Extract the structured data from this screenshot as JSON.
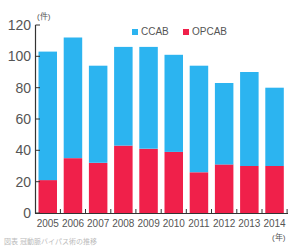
{
  "chart_data": {
    "type": "bar",
    "stacked": true,
    "title": "",
    "xlabel": "(年)",
    "ylabel": "(件)",
    "ylim": [
      0,
      120
    ],
    "yticks": [
      0,
      20,
      40,
      60,
      80,
      100,
      120
    ],
    "grid": false,
    "legend_position": "top-right",
    "categories": [
      "2005",
      "2006",
      "2007",
      "2008",
      "2009",
      "2010",
      "2011",
      "2012",
      "2013",
      "2014"
    ],
    "totals": [
      103,
      112,
      94,
      106,
      106,
      101,
      94,
      83,
      90,
      80
    ],
    "series": [
      {
        "name": "OPCAB",
        "color": "#f0204a",
        "values": [
          21,
          35,
          32,
          43,
          41,
          39,
          26,
          31,
          30,
          30
        ]
      },
      {
        "name": "CCAB",
        "color": "#2cb4f0",
        "values": [
          82,
          77,
          62,
          63,
          65,
          62,
          68,
          52,
          60,
          50
        ]
      }
    ]
  },
  "legend": {
    "ccab_label": "CCAB",
    "opcab_label": "OPCAB"
  },
  "axis": {
    "y_unit": "(件)",
    "x_unit": "(年)"
  },
  "caption": "図表 冠動脈バイパス術の推移"
}
